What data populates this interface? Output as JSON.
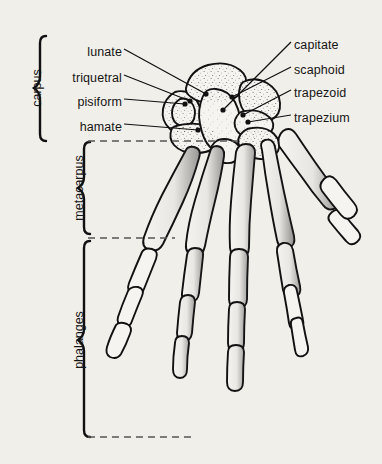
{
  "figure": {
    "background_color": "#f1efea",
    "ink_color": "#111111",
    "stipple_color": "#3a3a3a"
  },
  "bone_labels": {
    "left": [
      {
        "text": "lunate",
        "name": "label-lunate",
        "x": 122,
        "y": 52,
        "leader_to_x": 206,
        "leader_to_y": 94
      },
      {
        "text": "triquetral",
        "name": "label-triquetral",
        "x": 122,
        "y": 78,
        "leader_to_x": 190,
        "leader_to_y": 101
      },
      {
        "text": "pisiform",
        "name": "label-pisiform",
        "x": 122,
        "y": 102,
        "leader_to_x": 185,
        "leader_to_y": 104
      },
      {
        "text": "hamate",
        "name": "label-hamate",
        "x": 122,
        "y": 127,
        "leader_to_x": 198,
        "leader_to_y": 130
      }
    ],
    "right": [
      {
        "text": "capitate",
        "name": "label-capitate",
        "x": 293,
        "y": 45,
        "leader_to_x": 223,
        "leader_to_y": 110
      },
      {
        "text": "scaphoid",
        "name": "label-scaphoid",
        "x": 293,
        "y": 70,
        "leader_to_x": 232,
        "leader_to_y": 97
      },
      {
        "text": "trapezoid",
        "name": "label-trapezoid",
        "x": 293,
        "y": 93,
        "leader_to_x": 243,
        "leader_to_y": 115
      },
      {
        "text": "trapezium",
        "name": "label-trapezium",
        "x": 293,
        "y": 118,
        "leader_to_x": 248,
        "leader_to_y": 122
      }
    ]
  },
  "region_brackets": [
    {
      "text": "carpus",
      "name": "bracket-carpus",
      "brace_x": 40,
      "top": 36,
      "bottom": 141,
      "text_x": 30,
      "text_center_y": 88
    },
    {
      "text": "metacarpus",
      "name": "bracket-metacarpus",
      "brace_x": 84,
      "top": 142,
      "bottom": 234,
      "text_x": 72,
      "text_center_y": 188
    },
    {
      "text": "phalanges",
      "name": "bracket-phalanges",
      "brace_x": 84,
      "top": 241,
      "bottom": 437,
      "text_x": 72,
      "text_center_y": 340
    }
  ],
  "guide_lines": [
    {
      "name": "guide-carpus-metacarpus",
      "x1": 88,
      "y": 141,
      "x2": 238
    },
    {
      "name": "guide-metacarpus-phalanges",
      "x1": 88,
      "y": 238,
      "x2": 175
    },
    {
      "name": "guide-phalanges-distal",
      "x1": 88,
      "y": 437,
      "x2": 196
    }
  ]
}
